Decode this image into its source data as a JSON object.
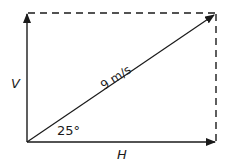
{
  "diagram": {
    "type": "vector-resolution",
    "resultant": {
      "label": "9 m/s",
      "magnitude": 9,
      "unit": "m/s"
    },
    "angle": {
      "label": "25°",
      "value": 25,
      "unit": "degrees"
    },
    "vertical_component": {
      "label": "V"
    },
    "horizontal_component": {
      "label": "H"
    },
    "colors": {
      "stroke": "#1a1a1a",
      "background": "#ffffff"
    }
  }
}
